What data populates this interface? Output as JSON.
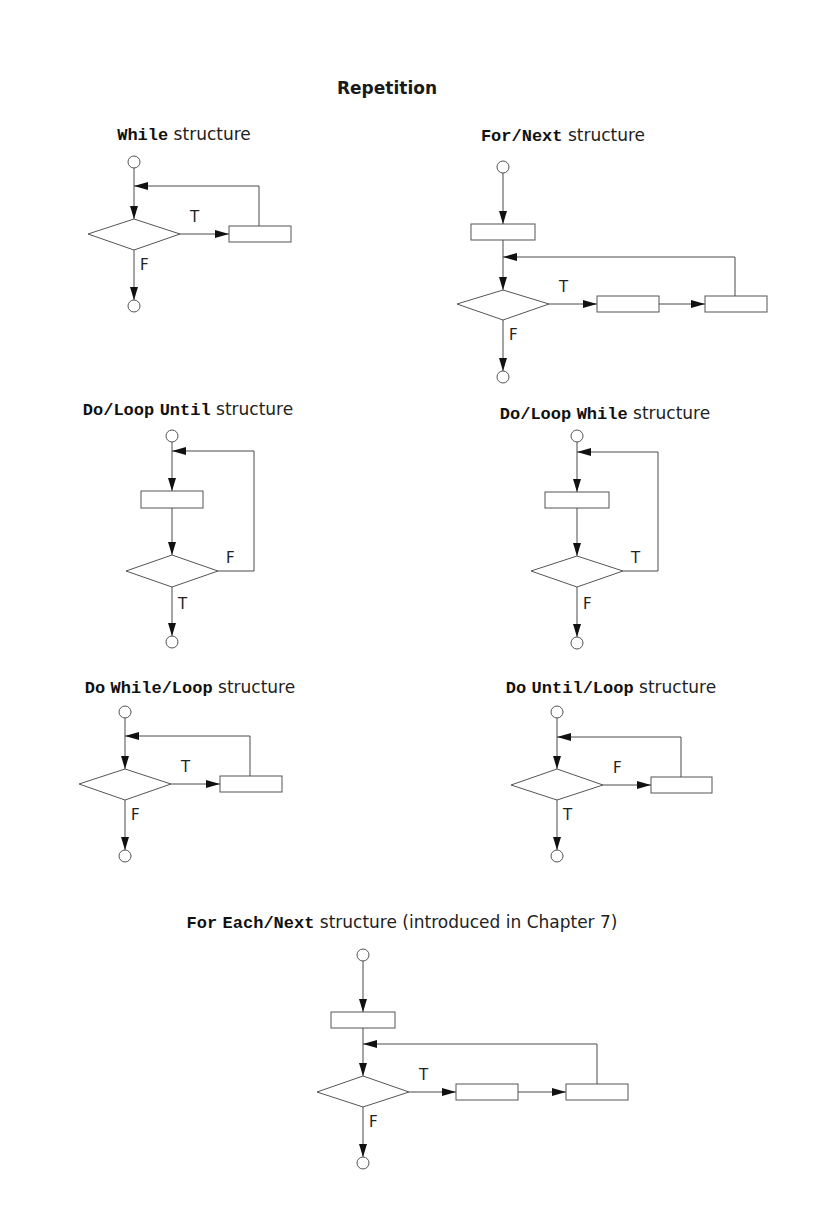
{
  "title": "Repetition",
  "structures": [
    {
      "id": "while",
      "heading": [
        {
          "text": "While",
          "kw": true
        },
        {
          "text": " structure",
          "kw": false
        }
      ],
      "kind": "pretest",
      "branch_label": "T",
      "exit_label": "F",
      "has_init": false,
      "body_boxes": 1
    },
    {
      "id": "for-next",
      "heading": [
        {
          "text": "For",
          "kw": true
        },
        {
          "text": "/",
          "kw": true
        },
        {
          "text": "Next",
          "kw": true
        },
        {
          "text": " structure",
          "kw": false
        }
      ],
      "kind": "pretest",
      "branch_label": "T",
      "exit_label": "F",
      "has_init": true,
      "body_boxes": 2
    },
    {
      "id": "do-loop-until",
      "heading": [
        {
          "text": "Do",
          "kw": true
        },
        {
          "text": "/",
          "kw": true
        },
        {
          "text": "Loop",
          "kw": true
        },
        {
          "text": " ",
          "kw": false
        },
        {
          "text": "Until",
          "kw": true
        },
        {
          "text": " structure",
          "kw": false
        }
      ],
      "kind": "posttest",
      "branch_label": "F",
      "exit_label": "T",
      "has_init": false,
      "body_boxes": 1
    },
    {
      "id": "do-loop-while",
      "heading": [
        {
          "text": "Do",
          "kw": true
        },
        {
          "text": "/",
          "kw": true
        },
        {
          "text": "Loop",
          "kw": true
        },
        {
          "text": " ",
          "kw": false
        },
        {
          "text": "While",
          "kw": true
        },
        {
          "text": " structure",
          "kw": false
        }
      ],
      "kind": "posttest",
      "branch_label": "T",
      "exit_label": "F",
      "has_init": false,
      "body_boxes": 1
    },
    {
      "id": "do-while-loop",
      "heading": [
        {
          "text": "Do",
          "kw": true
        },
        {
          "text": " ",
          "kw": false
        },
        {
          "text": "While",
          "kw": true
        },
        {
          "text": "/",
          "kw": true
        },
        {
          "text": "Loop",
          "kw": true
        },
        {
          "text": " structure",
          "kw": false
        }
      ],
      "kind": "pretest",
      "branch_label": "T",
      "exit_label": "F",
      "has_init": false,
      "body_boxes": 1
    },
    {
      "id": "do-until-loop",
      "heading": [
        {
          "text": "Do",
          "kw": true
        },
        {
          "text": " ",
          "kw": false
        },
        {
          "text": "Until",
          "kw": true
        },
        {
          "text": "/",
          "kw": true
        },
        {
          "text": "Loop",
          "kw": true
        },
        {
          "text": " structure",
          "kw": false
        }
      ],
      "kind": "pretest",
      "branch_label": "F",
      "exit_label": "T",
      "has_init": false,
      "body_boxes": 1
    },
    {
      "id": "for-each-next",
      "heading": [
        {
          "text": "For",
          "kw": true
        },
        {
          "text": " ",
          "kw": false
        },
        {
          "text": "Each",
          "kw": true
        },
        {
          "text": "/",
          "kw": true
        },
        {
          "text": "Next",
          "kw": true
        },
        {
          "text": " structure (introduced in Chapter 7)",
          "kw": false
        }
      ],
      "kind": "pretest",
      "branch_label": "T",
      "exit_label": "F",
      "has_init": true,
      "body_boxes": 2
    }
  ]
}
